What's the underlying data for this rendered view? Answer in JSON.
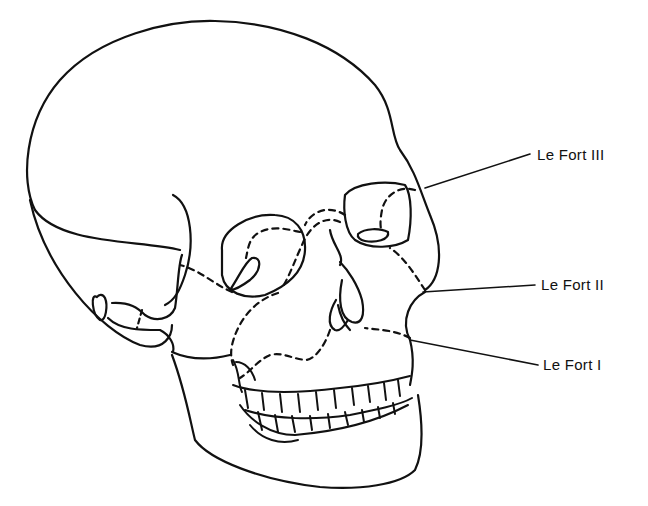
{
  "diagram": {
    "labels": [
      {
        "id": "le-fort-3",
        "text": "Le Fort III"
      },
      {
        "id": "le-fort-2",
        "text": "Le Fort II"
      },
      {
        "id": "le-fort-1",
        "text": "Le Fort I"
      }
    ],
    "colors": {
      "line": "#111111",
      "background": "#ffffff"
    }
  }
}
